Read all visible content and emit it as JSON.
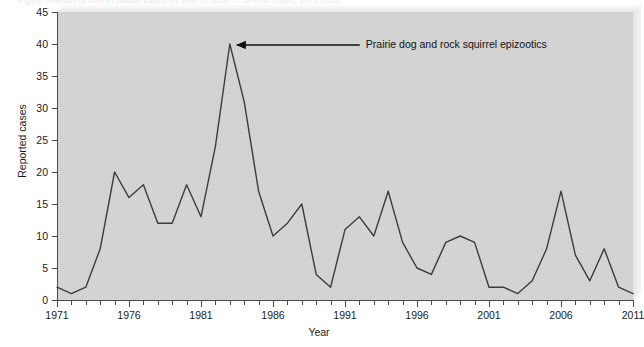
{
  "caption": {
    "text": "Figure. Number of human plague cases, by year of onset — United States, 1971–2011"
  },
  "chart_data": {
    "type": "line",
    "title": "",
    "xlabel": "Year",
    "ylabel": "Reported cases",
    "xlim": [
      1971,
      2011
    ],
    "ylim": [
      0,
      45
    ],
    "ytick_step": 5,
    "xtick_step": 5,
    "grid": false,
    "legend": "none",
    "line_color": "#3c3c3c",
    "plot_bg": "#d3d3d3",
    "x_ticklabels": [
      "1971",
      "1976",
      "1981",
      "1986",
      "1991",
      "1996",
      "2001",
      "2006",
      "2011"
    ],
    "y_ticklabels": [
      "0",
      "5",
      "10",
      "15",
      "20",
      "25",
      "30",
      "35",
      "40",
      "45"
    ],
    "x": [
      1971,
      1972,
      1973,
      1974,
      1975,
      1976,
      1977,
      1978,
      1979,
      1980,
      1981,
      1982,
      1983,
      1984,
      1985,
      1986,
      1987,
      1988,
      1989,
      1990,
      1991,
      1992,
      1993,
      1994,
      1995,
      1996,
      1997,
      1998,
      1999,
      2000,
      2001,
      2002,
      2003,
      2004,
      2005,
      2006,
      2007,
      2008,
      2009,
      2010,
      2011
    ],
    "values": [
      2,
      1,
      2,
      8,
      20,
      16,
      18,
      12,
      12,
      18,
      13,
      24,
      40,
      31,
      17,
      10,
      12,
      15,
      4,
      2,
      11,
      13,
      10,
      17,
      9,
      5,
      4,
      9,
      10,
      9,
      2,
      2,
      1,
      3,
      8,
      17,
      7,
      3,
      8,
      2,
      1
    ],
    "annotations": [
      {
        "text": "Prairie dog and rock squirrel epizootics",
        "points_to_x": 1983,
        "points_to_y": 40
      }
    ]
  }
}
